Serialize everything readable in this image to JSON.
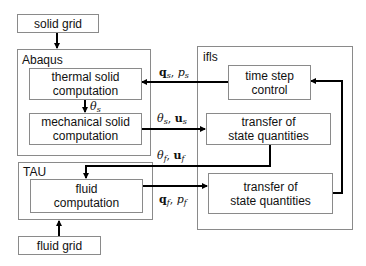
{
  "diagram": {
    "nodes": {
      "solid_grid": "solid grid",
      "abaqus": "Abaqus",
      "thermal": "thermal solid\ncomputation",
      "thermal_l1": "thermal solid",
      "thermal_l2": "computation",
      "mechanical_l1": "mechanical solid",
      "mechanical_l2": "computation",
      "tau": "TAU",
      "fluid_l1": "fluid",
      "fluid_l2": "computation",
      "fluid_grid": "fluid grid",
      "ifls": "ifls",
      "timestep_l1": "time step",
      "timestep_l2": "control",
      "transfer1_l1": "transfer of",
      "transfer1_l2": "state quantities",
      "transfer2_l1": "transfer of",
      "transfer2_l2": "state quantities"
    },
    "edges": {
      "qs_ps": {
        "a": "q",
        "a_sub": "s",
        "sep": ", ",
        "b": "p",
        "b_sub": "s"
      },
      "theta_s": {
        "a": "θ",
        "a_sub": "s"
      },
      "theta_s_us": {
        "a": "θ",
        "a_sub": "s",
        "sep": ", ",
        "b": "u",
        "b_sub": "s"
      },
      "theta_f_uf": {
        "a": "θ",
        "a_sub": "f",
        "sep": ", ",
        "b": "u",
        "b_sub": "f"
      },
      "qf_pf": {
        "a": "q",
        "a_sub": "f",
        "sep": ", ",
        "b": "p",
        "b_sub": "f"
      }
    },
    "colors": {
      "line": "#000000",
      "border": "#8a8a8a"
    }
  }
}
